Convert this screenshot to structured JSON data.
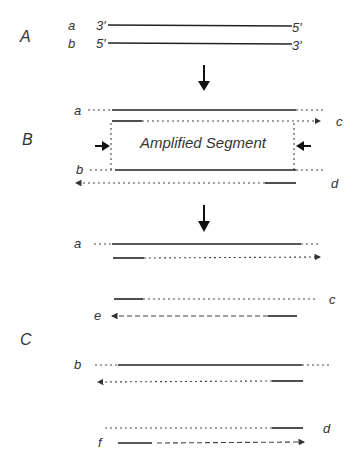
{
  "panels": {
    "A": {
      "label": "A",
      "strand_a": "a",
      "strand_b": "b",
      "a_left": "3′",
      "a_right": "5′",
      "b_left": "5′",
      "b_right": "3′"
    },
    "B": {
      "label": "B",
      "strand_a": "a",
      "strand_b": "b",
      "primer_c": "c",
      "primer_d": "d",
      "box_text": "Amplified Segment"
    },
    "C": {
      "label": "C",
      "strand_a": "a",
      "strand_b": "b",
      "c": "c",
      "d": "d",
      "e": "e",
      "f": "f"
    }
  }
}
